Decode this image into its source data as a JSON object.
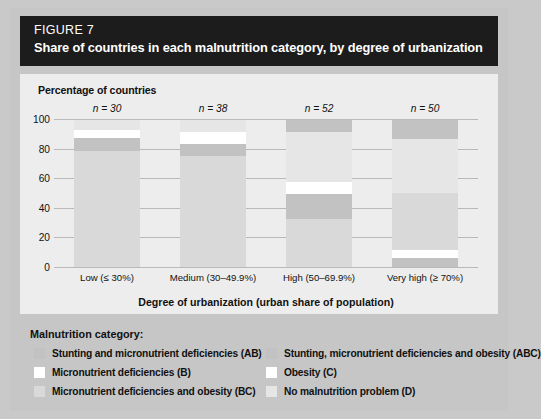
{
  "header": {
    "figure_label": "FIGURE 7",
    "title": "Share of countries in each malnutrition category, by degree of urbanization",
    "background": "#1c1c1c",
    "text_color": "#ffffff"
  },
  "chart_data": {
    "type": "bar",
    "subtype": "stacked-percent",
    "title": "Share of countries in each malnutrition category, by degree of urbanization",
    "ylabel": "Percentage of countries",
    "xlabel": "Degree of urbanization (urban share of population)",
    "ylim": [
      0,
      100
    ],
    "yticks": [
      0,
      20,
      40,
      60,
      80,
      100
    ],
    "ytick_labels": [
      "0",
      "20",
      "40",
      "60",
      "80",
      "100"
    ],
    "grid": true,
    "legend_position": "below",
    "categories": [
      "Low (≤ 30%)",
      "Medium (30–49.9%)",
      "High (50–69.9%)",
      "Very high (≥ 70%)"
    ],
    "group_annotations": [
      "n = 30",
      "n = 38",
      "n = 52",
      "n = 50"
    ],
    "series": [
      {
        "name": "Stunting and micronutrient deficiencies (AB)",
        "code": "AB",
        "color": "#c2c2c2",
        "values": [
          9,
          8,
          17,
          7
        ]
      },
      {
        "name": "Micronutrient deficiencies (B)",
        "code": "B",
        "color": "#ffffff",
        "values": [
          0,
          0,
          0,
          0
        ]
      },
      {
        "name": "Micronutrient deficiencies and obesity (BC)",
        "code": "BC",
        "color": "#d9d9d9",
        "values": [
          79,
          76,
          33,
          39
        ]
      },
      {
        "name": "Stunting, micronutrient deficiencies and obesity (ABC)",
        "code": "ABC",
        "color": "#c2c2c2",
        "values": [
          0,
          0,
          8,
          13
        ]
      },
      {
        "name": "Obesity (C)",
        "code": "C",
        "color": "#ffffff",
        "values": [
          5,
          8,
          8,
          5
        ]
      },
      {
        "name": "No malnutrition problem (D)",
        "code": "D",
        "color": "#e6e6e6",
        "values": [
          7,
          8,
          34,
          36
        ]
      }
    ],
    "stacks": [
      {
        "category": "Low (≤ 30%)",
        "n": 30,
        "segments": [
          {
            "code": "BC",
            "value": 79,
            "from": 0,
            "to": 79,
            "color": "#d9d9d9"
          },
          {
            "code": "AB",
            "value": 9,
            "from": 79,
            "to": 88,
            "color": "#c2c2c2"
          },
          {
            "code": "C",
            "value": 5,
            "from": 88,
            "to": 93,
            "color": "#ffffff"
          },
          {
            "code": "D",
            "value": 7,
            "from": 93,
            "to": 100,
            "color": "#e6e6e6"
          }
        ]
      },
      {
        "category": "Medium (30–49.9%)",
        "n": 38,
        "segments": [
          {
            "code": "BC",
            "value": 76,
            "from": 0,
            "to": 76,
            "color": "#d9d9d9"
          },
          {
            "code": "AB",
            "value": 8,
            "from": 76,
            "to": 84,
            "color": "#c2c2c2"
          },
          {
            "code": "C",
            "value": 8,
            "from": 84,
            "to": 92,
            "color": "#ffffff"
          },
          {
            "code": "D",
            "value": 8,
            "from": 92,
            "to": 100,
            "color": "#e6e6e6"
          }
        ]
      },
      {
        "category": "High (50–69.9%)",
        "n": 52,
        "segments": [
          {
            "code": "BC",
            "value": 33,
            "from": 0,
            "to": 33,
            "color": "#d9d9d9"
          },
          {
            "code": "AB",
            "value": 17,
            "from": 33,
            "to": 50,
            "color": "#c2c2c2"
          },
          {
            "code": "C",
            "value": 8,
            "from": 50,
            "to": 58,
            "color": "#ffffff"
          },
          {
            "code": "D",
            "value": 34,
            "from": 58,
            "to": 92,
            "color": "#e6e6e6"
          },
          {
            "code": "ABC",
            "value": 8,
            "from": 92,
            "to": 100,
            "color": "#c2c2c2"
          }
        ]
      },
      {
        "category": "Very high (≥ 70%)",
        "n": 50,
        "segments": [
          {
            "code": "AB",
            "value": 7,
            "from": 0,
            "to": 7,
            "color": "#c2c2c2"
          },
          {
            "code": "C",
            "value": 5,
            "from": 7,
            "to": 12,
            "color": "#ffffff"
          },
          {
            "code": "BC",
            "value": 39,
            "from": 12,
            "to": 51,
            "color": "#d9d9d9"
          },
          {
            "code": "D",
            "value": 36,
            "from": 51,
            "to": 87,
            "color": "#e6e6e6"
          },
          {
            "code": "ABC",
            "value": 13,
            "from": 87,
            "to": 100,
            "color": "#c2c2c2"
          }
        ]
      }
    ]
  },
  "legend": {
    "title": "Malnutrition category:",
    "items": [
      {
        "label": "Stunting and micronutrient deficiencies (AB)",
        "color": "#c2c2c2",
        "column": 0,
        "row": 0
      },
      {
        "label": "Micronutrient deficiencies (B)",
        "color": "#ffffff",
        "column": 0,
        "row": 1
      },
      {
        "label": "Micronutrient deficiencies and obesity (BC)",
        "color": "#d9d9d9",
        "column": 0,
        "row": 2
      },
      {
        "label": "Stunting, micronutrient deficiencies and obesity (ABC)",
        "color": "#c2c2c2",
        "column": 1,
        "row": 0
      },
      {
        "label": "Obesity (C)",
        "color": "#ffffff",
        "column": 1,
        "row": 1
      },
      {
        "label": "No malnutrition problem (D)",
        "color": "#e6e6e6",
        "column": 1,
        "row": 2
      }
    ]
  },
  "colors": {
    "card_background": "#c6c6c6",
    "plot_background": "#ededed",
    "gridline": "#b9b9b9",
    "text": "#111111"
  }
}
